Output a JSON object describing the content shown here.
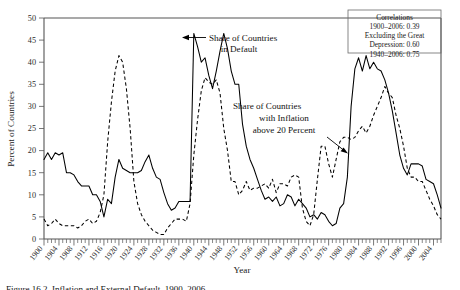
{
  "figure": {
    "xlabel": "Year",
    "ylabel": "Percent of Countries"
  },
  "annotations": {
    "default_label_line1": "Share of Countries",
    "default_label_line2": "in Default",
    "inflation_label_line1": "Share of Countries",
    "inflation_label_line2": "with Inflation",
    "inflation_label_line3": "above 20 Percent"
  },
  "correlations_box": {
    "title": "Correlations",
    "line1": "1900–2006: 0.39",
    "line2": "Excluding the Great",
    "line3": "Depression: 0.60",
    "line4": "1940–2006: 0.75"
  },
  "caption": "Figure 16.2. Inflation and External Default, 1900–2006",
  "chart_data": {
    "type": "line",
    "title": "",
    "xlabel": "Year",
    "ylabel": "Percent of Countries",
    "xlim": [
      1900,
      2006
    ],
    "ylim": [
      0,
      50
    ],
    "yticks": [
      0,
      5,
      10,
      15,
      20,
      25,
      30,
      35,
      40,
      45,
      50
    ],
    "xticks": [
      1900,
      1904,
      1908,
      1912,
      1916,
      1920,
      1924,
      1928,
      1932,
      1936,
      1940,
      1944,
      1948,
      1952,
      1956,
      1960,
      1964,
      1968,
      1972,
      1976,
      1980,
      1984,
      1988,
      1992,
      1996,
      2000,
      2004
    ],
    "grid": false,
    "legend": "annotations-with-arrows",
    "x": [
      1900,
      1901,
      1902,
      1903,
      1904,
      1905,
      1906,
      1907,
      1908,
      1909,
      1910,
      1911,
      1912,
      1913,
      1914,
      1915,
      1916,
      1917,
      1918,
      1919,
      1920,
      1921,
      1922,
      1923,
      1924,
      1925,
      1926,
      1927,
      1928,
      1929,
      1930,
      1931,
      1932,
      1933,
      1934,
      1935,
      1936,
      1937,
      1938,
      1939,
      1940,
      1941,
      1942,
      1943,
      1944,
      1945,
      1946,
      1947,
      1948,
      1949,
      1950,
      1951,
      1952,
      1953,
      1954,
      1955,
      1956,
      1957,
      1958,
      1959,
      1960,
      1961,
      1962,
      1963,
      1964,
      1965,
      1966,
      1967,
      1968,
      1969,
      1970,
      1971,
      1972,
      1973,
      1974,
      1975,
      1976,
      1977,
      1978,
      1979,
      1980,
      1981,
      1982,
      1983,
      1984,
      1985,
      1986,
      1987,
      1988,
      1989,
      1990,
      1991,
      1992,
      1993,
      1994,
      1995,
      1996,
      1997,
      1998,
      1999,
      2000,
      2001,
      2002,
      2003,
      2004,
      2005,
      2006
    ],
    "series": [
      {
        "name": "Share of Countries in Default",
        "style": "solid",
        "values": [
          18.0,
          19.5,
          18.0,
          19.5,
          19.0,
          19.5,
          15.0,
          15.0,
          14.5,
          13.0,
          12.0,
          12.0,
          12.0,
          10.0,
          10.0,
          8.5,
          5.0,
          9.0,
          8.0,
          14.0,
          18.0,
          16.0,
          15.5,
          15.0,
          15.0,
          15.0,
          15.5,
          17.5,
          19.0,
          16.0,
          14.0,
          13.5,
          10.5,
          8.0,
          6.5,
          7.0,
          8.5,
          8.5,
          8.5,
          8.5,
          46.5,
          43.5,
          40.0,
          41.0,
          37.0,
          34.0,
          38.0,
          42.5,
          46.5,
          43.0,
          38.0,
          35.0,
          35.0,
          26.0,
          21.0,
          18.0,
          16.0,
          13.5,
          11.0,
          9.0,
          9.5,
          8.5,
          9.5,
          7.5,
          8.0,
          10.0,
          9.5,
          7.5,
          9.0,
          8.0,
          7.0,
          5.0,
          5.5,
          4.5,
          6.0,
          5.5,
          4.0,
          3.0,
          3.5,
          7.0,
          8.0,
          14.0,
          30.0,
          38.5,
          41.0,
          38.0,
          41.5,
          38.5,
          40.0,
          38.5,
          38.0,
          36.0,
          33.0,
          29.0,
          24.0,
          19.0,
          16.0,
          14.5,
          17.0,
          17.0,
          17.0,
          16.5,
          13.5,
          13.0,
          12.5,
          10.0,
          7.0
        ]
      },
      {
        "name": "Share of Countries with Inflation above 20 Percent",
        "style": "dashed",
        "values": [
          4.5,
          3.0,
          3.5,
          4.5,
          3.5,
          3.0,
          3.0,
          3.0,
          3.0,
          2.5,
          3.0,
          4.0,
          4.5,
          3.5,
          4.0,
          6.0,
          10.0,
          22.0,
          31.0,
          38.0,
          41.5,
          40.0,
          34.0,
          25.0,
          13.0,
          8.0,
          5.5,
          4.0,
          3.0,
          2.0,
          1.5,
          1.0,
          1.0,
          2.5,
          3.5,
          4.5,
          4.5,
          4.5,
          4.0,
          8.0,
          19.0,
          27.0,
          33.5,
          36.5,
          35.5,
          35.0,
          36.0,
          33.0,
          25.0,
          20.0,
          13.0,
          13.0,
          10.0,
          11.0,
          13.0,
          11.0,
          11.5,
          11.5,
          12.0,
          12.5,
          11.5,
          13.5,
          10.5,
          12.5,
          12.5,
          12.0,
          14.0,
          14.5,
          14.0,
          7.0,
          4.0,
          3.0,
          5.5,
          13.5,
          21.0,
          21.0,
          17.0,
          14.0,
          18.0,
          22.0,
          23.0,
          23.0,
          22.5,
          23.0,
          24.5,
          25.5,
          24.0,
          25.5,
          28.0,
          30.0,
          32.0,
          34.5,
          33.0,
          32.0,
          28.0,
          25.0,
          21.0,
          16.0,
          14.0,
          14.0,
          13.0,
          13.0,
          11.0,
          9.0,
          7.5,
          5.5,
          4.5
        ]
      }
    ]
  }
}
